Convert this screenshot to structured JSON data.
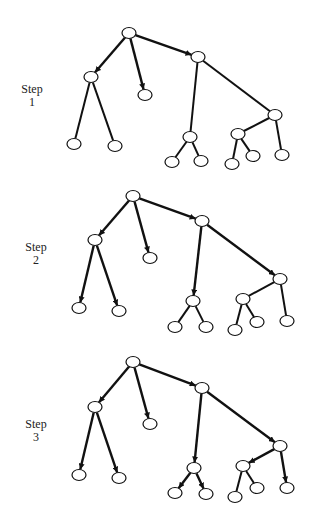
{
  "colors": {
    "stroke": "#111111",
    "node_fill": "#ffffff",
    "background": "#ffffff"
  },
  "node_radius": {
    "rx": 7,
    "ry": 5.5
  },
  "steps": [
    {
      "label_word": "Step",
      "label_num": "1",
      "label_pos": [
        14,
        83
      ],
      "nodes": {
        "root": [
          129,
          33
        ],
        "L": [
          91,
          77
        ],
        "M": [
          145,
          95
        ],
        "B": [
          198,
          57
        ],
        "L1": [
          74,
          144
        ],
        "L2": [
          115,
          146
        ],
        "D": [
          190,
          137
        ],
        "E": [
          275,
          115
        ],
        "F": [
          238,
          134
        ],
        "D1": [
          172,
          162
        ],
        "D2": [
          201,
          161
        ],
        "F1": [
          232,
          164
        ],
        "F2": [
          253,
          156
        ],
        "E1": [
          282,
          155
        ]
      },
      "edges": [
        {
          "from": "root",
          "to": "L",
          "arrow": true
        },
        {
          "from": "root",
          "to": "M",
          "arrow": true
        },
        {
          "from": "root",
          "to": "B",
          "arrow": true
        },
        {
          "from": "L",
          "to": "L1",
          "arrow": false
        },
        {
          "from": "L",
          "to": "L2",
          "arrow": false
        },
        {
          "from": "B",
          "to": "D",
          "arrow": false
        },
        {
          "from": "B",
          "to": "E",
          "arrow": false
        },
        {
          "from": "D",
          "to": "D1",
          "arrow": false
        },
        {
          "from": "D",
          "to": "D2",
          "arrow": false
        },
        {
          "from": "E",
          "to": "F",
          "arrow": false
        },
        {
          "from": "E",
          "to": "E1",
          "arrow": false
        },
        {
          "from": "F",
          "to": "F1",
          "arrow": false
        },
        {
          "from": "F",
          "to": "F2",
          "arrow": false
        }
      ]
    },
    {
      "label_word": "Step",
      "label_num": "2",
      "label_pos": [
        18,
        241
      ],
      "nodes": {
        "root": [
          133,
          196
        ],
        "L": [
          95,
          240
        ],
        "M": [
          150,
          258
        ],
        "B": [
          202,
          221
        ],
        "L1": [
          79,
          308
        ],
        "L2": [
          119,
          311
        ],
        "D": [
          193,
          301
        ],
        "E": [
          280,
          279
        ],
        "F": [
          243,
          299
        ],
        "D1": [
          175,
          327
        ],
        "D2": [
          206,
          327
        ],
        "F1": [
          235,
          330
        ],
        "F2": [
          257,
          322
        ],
        "E1": [
          287,
          321
        ]
      },
      "edges": [
        {
          "from": "root",
          "to": "L",
          "arrow": true
        },
        {
          "from": "root",
          "to": "M",
          "arrow": true
        },
        {
          "from": "root",
          "to": "B",
          "arrow": true
        },
        {
          "from": "L",
          "to": "L1",
          "arrow": true
        },
        {
          "from": "L",
          "to": "L2",
          "arrow": true
        },
        {
          "from": "B",
          "to": "D",
          "arrow": true
        },
        {
          "from": "B",
          "to": "E",
          "arrow": true
        },
        {
          "from": "D",
          "to": "D1",
          "arrow": false
        },
        {
          "from": "D",
          "to": "D2",
          "arrow": false
        },
        {
          "from": "E",
          "to": "F",
          "arrow": false
        },
        {
          "from": "E",
          "to": "E1",
          "arrow": false
        },
        {
          "from": "F",
          "to": "F1",
          "arrow": false
        },
        {
          "from": "F",
          "to": "F2",
          "arrow": false
        }
      ]
    },
    {
      "label_word": "Step",
      "label_num": "3",
      "label_pos": [
        18,
        418
      ],
      "nodes": {
        "root": [
          133,
          362
        ],
        "L": [
          95,
          407
        ],
        "M": [
          150,
          424
        ],
        "B": [
          202,
          388
        ],
        "L1": [
          79,
          475
        ],
        "L2": [
          119,
          478
        ],
        "D": [
          194,
          468
        ],
        "E": [
          280,
          446
        ],
        "F": [
          243,
          466
        ],
        "D1": [
          175,
          493
        ],
        "D2": [
          206,
          494
        ],
        "F1": [
          235,
          497
        ],
        "F2": [
          257,
          488
        ],
        "E1": [
          287,
          488
        ]
      },
      "edges": [
        {
          "from": "root",
          "to": "L",
          "arrow": true
        },
        {
          "from": "root",
          "to": "M",
          "arrow": true
        },
        {
          "from": "root",
          "to": "B",
          "arrow": true
        },
        {
          "from": "L",
          "to": "L1",
          "arrow": true
        },
        {
          "from": "L",
          "to": "L2",
          "arrow": true
        },
        {
          "from": "B",
          "to": "D",
          "arrow": true
        },
        {
          "from": "B",
          "to": "E",
          "arrow": true
        },
        {
          "from": "D",
          "to": "D1",
          "arrow": true
        },
        {
          "from": "D",
          "to": "D2",
          "arrow": true
        },
        {
          "from": "E",
          "to": "F",
          "arrow": true
        },
        {
          "from": "E",
          "to": "E1",
          "arrow": true
        },
        {
          "from": "F",
          "to": "F1",
          "arrow": false
        },
        {
          "from": "F",
          "to": "F2",
          "arrow": false
        }
      ]
    }
  ]
}
